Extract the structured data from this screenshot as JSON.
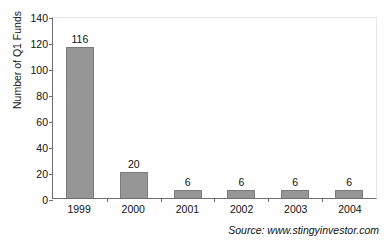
{
  "chart_data": {
    "type": "bar",
    "title": "",
    "xlabel": "",
    "ylabel": "Number of Q1 Funds",
    "categories": [
      "1999",
      "2000",
      "2001",
      "2002",
      "2003",
      "2004"
    ],
    "values": [
      116,
      20,
      6,
      6,
      6,
      6
    ],
    "data_labels": [
      "116",
      "20",
      "6",
      "6",
      "6",
      "6"
    ],
    "ylim": [
      0,
      140
    ],
    "ytick_values": [
      0,
      20,
      40,
      60,
      80,
      100,
      120,
      140
    ],
    "ytick_labels": [
      "0",
      "20",
      "40",
      "60",
      "80",
      "100",
      "120",
      "140"
    ],
    "grid": false,
    "legend": false,
    "legend_position": "none",
    "bar_color": "#969696",
    "bar_border_color": "#7b7b7b",
    "axis_color": "#6e6e6e",
    "plot_background": "#ffffff"
  },
  "annotations": {
    "source": "Source: www.stingyinvestor.com"
  }
}
